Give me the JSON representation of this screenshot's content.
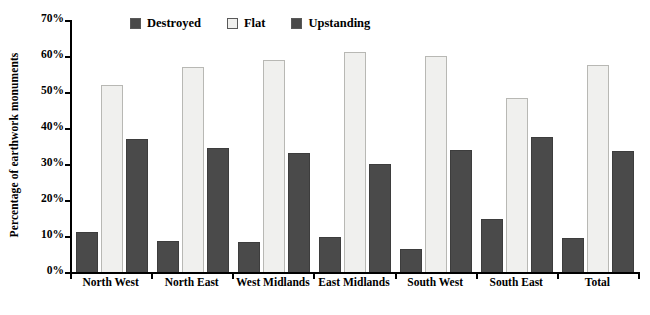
{
  "chart_data": {
    "type": "bar",
    "title": "",
    "subtitle": "",
    "xlabel": "",
    "ylabel": "Percentage of earthwork monuments",
    "ylim": [
      0,
      70
    ],
    "y_tick_labels": [
      "0%",
      "10%",
      "20%",
      "30%",
      "40%",
      "50%",
      "60%",
      "70%"
    ],
    "y_tick_values": [
      0,
      10,
      20,
      30,
      40,
      50,
      60,
      70
    ],
    "grid": false,
    "legend_position": "top",
    "categories": [
      "North West",
      "North East",
      "West Midlands",
      "East Midlands",
      "South West",
      "South East",
      "Total"
    ],
    "series": [
      {
        "name": "Destroyed",
        "color": "#4a4a4a",
        "values": [
          11.0,
          8.7,
          8.3,
          9.7,
          6.5,
          14.8,
          9.4
        ]
      },
      {
        "name": "Flat",
        "color": "#f0f0ee",
        "values": [
          52.0,
          57.0,
          59.0,
          61.0,
          60.0,
          48.2,
          57.5
        ]
      },
      {
        "name": "Upstanding",
        "color": "#4a4a4a",
        "values": [
          37.0,
          34.5,
          33.0,
          30.0,
          34.0,
          37.4,
          33.5
        ]
      }
    ]
  }
}
